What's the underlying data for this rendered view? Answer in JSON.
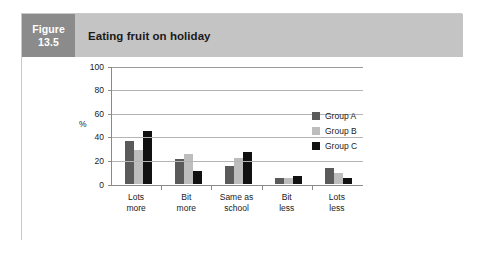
{
  "figure": {
    "label_line1": "Figure",
    "label_line2": "13.5",
    "title": "Eating fruit on holiday"
  },
  "colors": {
    "figure_box": "#8b8b8b",
    "title_bar": "#c4c4c4",
    "group_a": "#5a5a5a",
    "group_b": "#bdbdbd",
    "group_c": "#111111",
    "gridline": "#b4b4b4",
    "axis": "#8a8a8a"
  },
  "chart_data": {
    "type": "bar",
    "title": "Eating fruit on holiday",
    "xlabel": "",
    "ylabel": "%",
    "ylim": [
      0,
      100
    ],
    "yticks": [
      0,
      20,
      40,
      60,
      80,
      100
    ],
    "grid": true,
    "legend_position": "right",
    "categories": [
      "Lots more",
      "Bit more",
      "Same as school",
      "Bit less",
      "Lots less"
    ],
    "category_lines": [
      [
        "Lots",
        "more"
      ],
      [
        "Bit",
        "more"
      ],
      [
        "Same as",
        "school"
      ],
      [
        "Bit",
        "less"
      ],
      [
        "Lots",
        "less"
      ]
    ],
    "series": [
      {
        "name": "Group A",
        "values": [
          37,
          21,
          15,
          5,
          14
        ]
      },
      {
        "name": "Group B",
        "values": [
          29,
          26,
          22,
          5,
          9
        ]
      },
      {
        "name": "Group C",
        "values": [
          45,
          11,
          27,
          7,
          5
        ]
      }
    ]
  },
  "legend": {
    "items": [
      {
        "label": "Group A"
      },
      {
        "label": "Group B"
      },
      {
        "label": "Group C"
      }
    ]
  }
}
